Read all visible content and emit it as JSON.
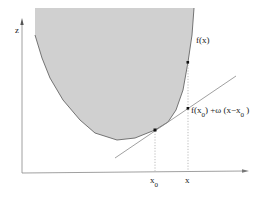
{
  "diagram": {
    "axes": {
      "vertical_label": "z",
      "horizontal_label": ""
    },
    "curve_label": "f(x)",
    "tangent_label": {
      "prefix": "f(x",
      "sub1": "0",
      "middle": ") +ω (x−x",
      "sub2": "0",
      "suffix": " )"
    },
    "x_ticks": [
      {
        "label": "x",
        "sub": "0"
      },
      {
        "label": "x",
        "sub": ""
      }
    ],
    "colors": {
      "epigraph_fill": "#d0d0d0",
      "curve": "#555555",
      "axis": "#888888",
      "tangent": "#888888",
      "guide": "#aaaaaa",
      "point": "#111111"
    }
  }
}
